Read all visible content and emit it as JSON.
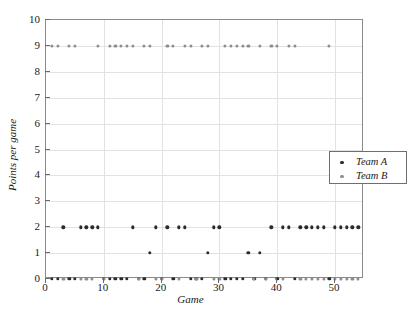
{
  "chart_data": {
    "type": "scatter",
    "title": "",
    "xlabel": "Game",
    "ylabel": "Points per game",
    "xlim": [
      0,
      55
    ],
    "ylim": [
      0,
      10
    ],
    "grid": true,
    "legend_position": "center-right",
    "xticks": [
      0,
      10,
      20,
      30,
      40,
      50
    ],
    "xtick_labels": [
      "0",
      "10",
      "20",
      "30",
      "40",
      "50"
    ],
    "yticks": [
      0,
      1,
      2,
      3,
      4,
      5,
      6,
      7,
      8,
      9,
      10
    ],
    "ytick_labels": [
      "0",
      "1",
      "2",
      "3",
      "4",
      "5",
      "6",
      "7",
      "8",
      "9",
      "10"
    ],
    "series": [
      {
        "name": "Team A",
        "marker": "circle",
        "color": "#2b2b2b",
        "x": [
          1,
          2,
          3,
          4,
          5,
          6,
          7,
          8,
          9,
          10,
          11,
          12,
          13,
          14,
          15,
          16,
          17,
          18,
          19,
          20,
          21,
          22,
          23,
          24,
          25,
          26,
          27,
          28,
          29,
          30,
          31,
          32,
          33,
          34,
          35,
          36,
          37,
          38,
          39,
          40,
          41,
          42,
          43,
          44,
          45,
          46,
          47,
          48,
          49,
          50,
          51,
          52,
          53,
          54
        ],
        "y": [
          0,
          0,
          2,
          0,
          0,
          2,
          2,
          2,
          2,
          0,
          0,
          0,
          0,
          0,
          2,
          0,
          0,
          1,
          2,
          0,
          2,
          0,
          2,
          2,
          0,
          0,
          0,
          1,
          2,
          2,
          0,
          0,
          0,
          0,
          1,
          0,
          1,
          0,
          2,
          0,
          2,
          2,
          0,
          2,
          2,
          2,
          2,
          2,
          0,
          2,
          2,
          2,
          2,
          2
        ]
      },
      {
        "name": "Team B",
        "marker": "circle",
        "color": "#8e8e8e",
        "x": [
          1,
          2,
          3,
          4,
          5,
          6,
          7,
          8,
          9,
          10,
          11,
          12,
          13,
          14,
          15,
          16,
          17,
          18,
          19,
          20,
          21,
          22,
          23,
          24,
          25,
          26,
          27,
          28,
          29,
          30,
          31,
          32,
          33,
          34,
          35,
          36,
          37,
          38,
          39,
          40,
          41,
          42,
          43,
          44,
          45,
          46,
          47,
          48,
          49,
          50,
          51,
          52,
          53,
          54
        ],
        "y": [
          9,
          9,
          0,
          9,
          9,
          0,
          0,
          0,
          9,
          0,
          9,
          9,
          9,
          9,
          9,
          0,
          9,
          9,
          0,
          0,
          9,
          9,
          0,
          9,
          9,
          0,
          9,
          9,
          0,
          0,
          9,
          9,
          9,
          9,
          9,
          0,
          9,
          0,
          9,
          9,
          0,
          9,
          9,
          0,
          0,
          0,
          0,
          0,
          9,
          0,
          0,
          0,
          0,
          0
        ]
      }
    ],
    "legend": [
      {
        "label": "Team A",
        "color": "#2b2b2b"
      },
      {
        "label": "Team B",
        "color": "#8e8e8e"
      }
    ]
  },
  "axes": {
    "x_title": "Game",
    "y_title": "Points per game"
  }
}
